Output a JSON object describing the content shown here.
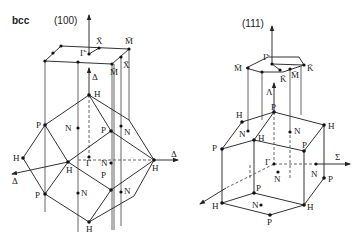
{
  "lattice_label": "bcc",
  "panels": [
    {
      "surface": "(100)",
      "surface_points": [
        "Γ̄",
        "X̄",
        "M̄",
        "X̄",
        "M̄"
      ],
      "axes": [
        "Δ",
        "Δ",
        "Δ"
      ],
      "bulk_points": {
        "H": [
          "H",
          "H",
          "H",
          "H",
          "H"
        ],
        "P": [
          "P",
          "P",
          "P",
          "P"
        ],
        "N": [
          "N",
          "N",
          "N",
          "N",
          "N"
        ],
        "Gamma": "Γ"
      }
    },
    {
      "surface": "(111)",
      "surface_points": [
        "Γ̄",
        "M̄",
        "K̄",
        "K̄",
        "M̄"
      ],
      "axes": [
        "Λ",
        "Σ"
      ],
      "bulk_points": {
        "H": [
          "H",
          "H",
          "H",
          "H",
          "H"
        ],
        "P": [
          "P",
          "P",
          "P",
          "P",
          "P",
          "P"
        ],
        "N": [
          "N",
          "N",
          "N",
          "N",
          "N"
        ],
        "Gamma": "Γ"
      }
    }
  ],
  "labels": {
    "bcc": "bcc",
    "p100": "(100)",
    "p111": "(111)",
    "Gbar": "Γ̄",
    "Xbar": "X̄",
    "Mbar": "M̄",
    "Kbar": "K̄",
    "Delta": "Δ",
    "Lambda": "Λ",
    "Sigma": "Σ",
    "Gamma": "Γ",
    "H": "H",
    "P": "P",
    "N": "N"
  }
}
